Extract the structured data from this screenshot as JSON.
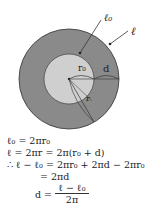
{
  "diagram": {
    "colors": {
      "outer_ring": "#8a8a8a",
      "inner_disk": "#cfcfcf",
      "stroke": "#333333",
      "background": "#ffffff"
    },
    "labels": {
      "l0": "ℓ₀",
      "l": "ℓ",
      "r0": "r₀",
      "d": "d",
      "r": "r"
    }
  },
  "equations": {
    "line1": "ℓ₀ = 2πr₀",
    "line2": "ℓ = 2πr = 2π(r₀ + d)",
    "line3": "∴ ℓ − ℓ₀ = 2πr₀ + 2πd − 2πr₀",
    "line4": "= 2πd",
    "line5_lhs": "d =",
    "line5_num": "ℓ − ℓ₀",
    "line5_den": "2π"
  }
}
